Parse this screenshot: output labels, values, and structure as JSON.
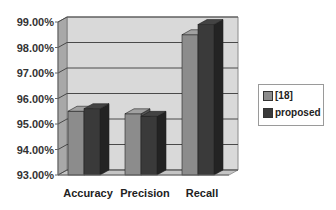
{
  "chart_data": {
    "type": "bar",
    "style": "3d-clustered-column",
    "title": "",
    "xlabel": "",
    "ylabel": "",
    "categories": [
      "Accuracy",
      "Precision",
      "Recall"
    ],
    "series": [
      {
        "name": "[18]",
        "values": [
          95.5,
          95.4,
          98.5
        ],
        "color": "#8c8c8c"
      },
      {
        "name": "proposed",
        "values": [
          95.6,
          95.3,
          98.9
        ],
        "color": "#3a3a3a"
      }
    ],
    "values_are_estimates": true,
    "estimate_note": "No data labels in source image; values estimated from bar heights against gridlines, approx. ±0.1 percentage point.",
    "ylim": [
      93,
      99
    ],
    "yticks": [
      "93.00%",
      "94.00%",
      "95.00%",
      "96.00%",
      "97.00%",
      "98.00%",
      "99.00%"
    ],
    "grid": true,
    "legend_position": "right"
  },
  "axis": {
    "y_ticks": [
      "99.00%",
      "98.00%",
      "97.00%",
      "96.00%",
      "95.00%",
      "94.00%",
      "93.00%"
    ],
    "x_labels": [
      "Accuracy",
      "Precision",
      "Recall"
    ]
  },
  "legend": {
    "items": [
      {
        "label": "[18]",
        "color": "#8c8c8c"
      },
      {
        "label": "proposed",
        "color": "#3a3a3a"
      }
    ]
  }
}
